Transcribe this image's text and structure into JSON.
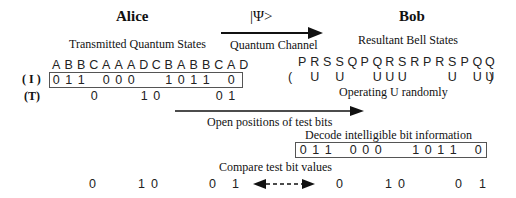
{
  "alice": {
    "title": "Alice",
    "subtitle": "Transmitted Quantum States",
    "letters": [
      "A",
      "B",
      "B",
      "C",
      "A",
      "A",
      "A",
      "D",
      "C",
      "B",
      "A",
      "B",
      "B",
      "C",
      "A",
      "D"
    ],
    "row_i_label": "( I )",
    "row_t_label": "(T)",
    "info_bits": [
      "0",
      "1",
      "1",
      " ",
      "0",
      "0",
      "0",
      " ",
      " ",
      "1",
      "0",
      "1",
      "1",
      " ",
      "0",
      " "
    ],
    "test_bits": [
      " ",
      " ",
      "0",
      " ",
      " ",
      " ",
      "1",
      "0",
      " ",
      " ",
      " ",
      " ",
      "0",
      "1",
      " ",
      " "
    ]
  },
  "channel": {
    "state_label": "|Ψ>",
    "label": "Quantum Channel"
  },
  "bob": {
    "title": "Bob",
    "subtitle": "Resultant Bell States",
    "letters": [
      "P",
      "R",
      "S",
      "S",
      "Q",
      "P",
      "Q",
      "R",
      "S",
      "R",
      "P",
      "R",
      "S",
      "P",
      "Q",
      "Q"
    ],
    "u_open": "(",
    "u_marks": [
      " ",
      "U",
      " ",
      "U",
      " ",
      " ",
      "U",
      "U",
      "U",
      " ",
      " ",
      " ",
      "U",
      " ",
      "U",
      "U"
    ],
    "u_close": ")",
    "operation_label": "Operating U randomly"
  },
  "open_positions": {
    "label": "Open positions of test bits"
  },
  "decode": {
    "label": "Decode intelligible bit information",
    "bits": [
      "0",
      "1",
      "1",
      " ",
      "0",
      "0",
      "0",
      " ",
      " ",
      "1",
      "0",
      "1",
      "1",
      " ",
      "0"
    ]
  },
  "compare": {
    "label": "Compare test bit values",
    "alice_bits": [
      "0",
      "1",
      "0",
      "0",
      "1"
    ],
    "bob_bits": [
      "0",
      "1",
      "0",
      "0",
      "1"
    ]
  }
}
